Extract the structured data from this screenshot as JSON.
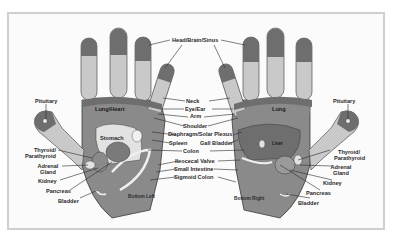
{
  "diagram": {
    "colors": {
      "background": "#fbfbfb",
      "frame": "#cfcfcf",
      "dark_zone": "#6e6e6e",
      "mid_zone": "#8a8a8a",
      "light_zone": "#c9c9c9",
      "pale_zone": "#e2e2e2",
      "outline": "#3a3a3a",
      "text": "#2a2a2a"
    },
    "center_labels": {
      "head": "Head/Brain/Sinus",
      "neck": "Neck",
      "eye_ear": "Eye/Ear",
      "arm": "Arm",
      "shoulder": "Shoulder",
      "diaphragm": "Diaphragm/Solar Plexus",
      "spleen": "Spleen",
      "gall_bladder": "Gall Bladder",
      "colon": "Colon",
      "ileocecal": "Ileocecal Valve",
      "small_intestine": "Small Intestine",
      "sigmoid": "Sigmoid Colon"
    },
    "left_hand": {
      "caption": "Bottom Left",
      "pituitary": "Pituitary",
      "lung_heart": "Lung/Heart",
      "stomach": "Stomach",
      "thyroid": "Thyroid/",
      "parathyroid": "Parathyroid",
      "adrenal": "Adrenal",
      "gland": "Gland",
      "kidney": "Kidney",
      "pancreas": "Pancreas",
      "bladder": "Bladder"
    },
    "right_hand": {
      "caption": "Bottom Right",
      "pituitary": "Pituitary",
      "lung": "Lung",
      "liver": "Liver",
      "thyroid": "Thyroid/",
      "parathyroid": "Parathyroid",
      "adrenal": "Adrenal",
      "gland": "Gland",
      "kidney": "Kidney",
      "pancreas": "Pancreas",
      "bladder": "Bladder"
    }
  }
}
